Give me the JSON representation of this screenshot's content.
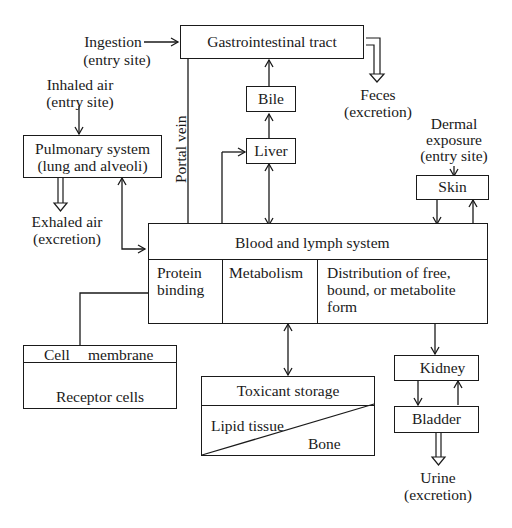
{
  "diagram": {
    "entry_sites": {
      "ingestion": {
        "line1": "Ingestion",
        "line2": "(entry site)"
      },
      "inhaled_air": {
        "line1": "Inhaled air",
        "line2": "(entry site)"
      },
      "dermal": {
        "line1": "Dermal",
        "line2": "exposure",
        "line3": "(entry site)"
      }
    },
    "nodes": {
      "gi_tract": "Gastrointestinal tract",
      "bile": "Bile",
      "liver": "Liver",
      "pulmonary": {
        "line1": "Pulmonary system",
        "line2": "(lung and alveoli)"
      },
      "skin": "Skin",
      "blood_lymph": {
        "title": "Blood and lymph system",
        "protein_binding": {
          "line1": "Protein",
          "line2": "binding"
        },
        "metabolism": "Metabolism",
        "distribution": {
          "line1": "Distribution of free,",
          "line2": "bound, or metabolite",
          "line3": "form"
        }
      },
      "cell": {
        "membrane": "Cell",
        "membrane2": "membrane",
        "receptor": "Receptor cells"
      },
      "storage": {
        "title": "Toxicant storage",
        "lipid": "Lipid tissue",
        "bone": "Bone"
      },
      "kidney": "Kidney",
      "bladder": "Bladder"
    },
    "excretion": {
      "feces": {
        "line1": "Feces",
        "line2": "(excretion)"
      },
      "exhaled": {
        "line1": "Exhaled air",
        "line2": "(excretion)"
      },
      "urine": {
        "line1": "Urine",
        "line2": "(excretion)"
      }
    },
    "portal_vein": "Portal vein"
  }
}
